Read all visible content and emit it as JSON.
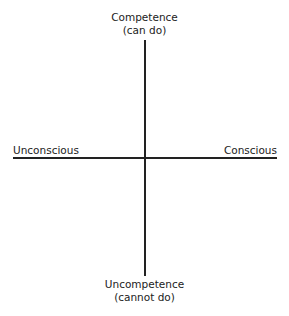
{
  "diagram": {
    "axes": {
      "vertical": {
        "top": {
          "line1": "Competence",
          "line2": "(can do)"
        },
        "bottom": {
          "line1": "Uncompetence",
          "line2": "(cannot do)"
        }
      },
      "horizontal": {
        "left": "Unconscious",
        "right": "Conscious"
      }
    },
    "colors": {
      "line": "#222222",
      "text": "#222222",
      "background": "#ffffff"
    }
  }
}
